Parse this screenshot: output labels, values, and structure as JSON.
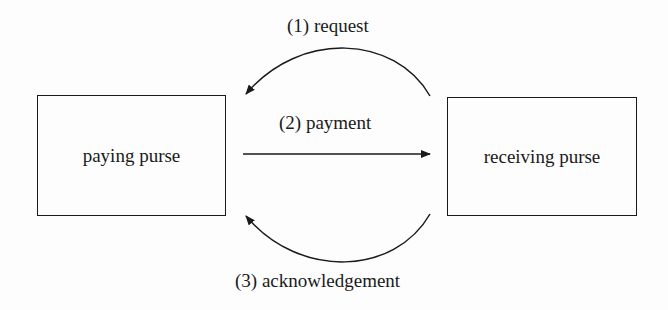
{
  "nodes": {
    "left": {
      "label": "paying purse"
    },
    "right": {
      "label": "receiving purse"
    }
  },
  "edges": [
    {
      "label": "(1) request",
      "from": "receiving purse",
      "to": "paying purse"
    },
    {
      "label": "(2) payment",
      "from": "paying purse",
      "to": "receiving purse"
    },
    {
      "label": "(3) acknowledgement",
      "from": "receiving purse",
      "to": "paying purse"
    }
  ]
}
